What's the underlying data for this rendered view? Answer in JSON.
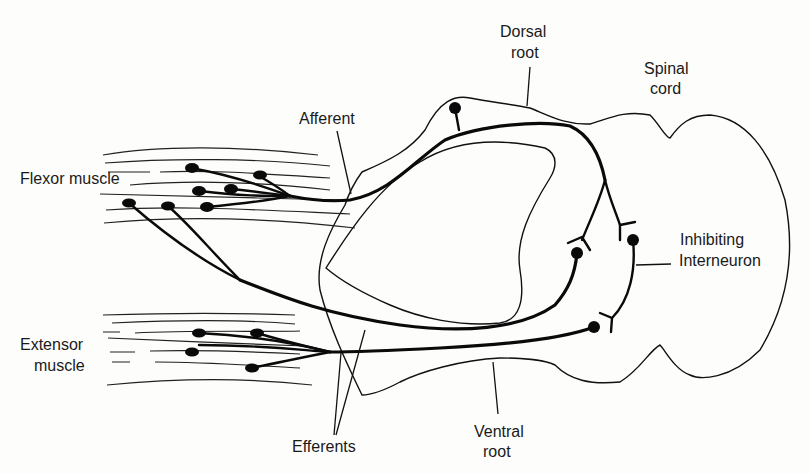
{
  "figure": {
    "type": "anatomical diagram",
    "labels": {
      "dorsal_root": [
        "Dorsal",
        "root"
      ],
      "spinal_cord": [
        "Spinal",
        "cord"
      ],
      "afferent": "Afferent",
      "flexor_muscle": "Flexor muscle",
      "inhibiting_interneuron": [
        "Inhibiting",
        "Interneuron"
      ],
      "extensor_muscle": [
        "Extensor",
        "muscle"
      ],
      "efferents": "Efferents",
      "ventral_root": [
        "Ventral",
        "root"
      ]
    },
    "colors": {
      "background": "#fdfdfc",
      "ink": "#0a0a0a"
    }
  }
}
